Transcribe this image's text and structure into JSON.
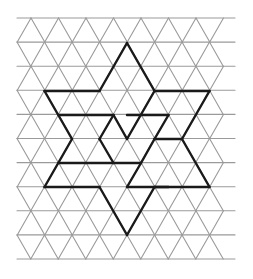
{
  "diagram": {
    "type": "triangular-grid-star",
    "colors": {
      "background": "#ffffff",
      "grid": "#9a9a9a",
      "figure": "#1a1a1a"
    },
    "grid": {
      "rows": 10,
      "row_spacing": 24.1,
      "col_spacing": 27.5,
      "top": 18,
      "left_even_row": 31,
      "left_odd_row": 17,
      "left_edge": 17,
      "right_edge": 235
    },
    "star_segments": [
      [
        [
          44.5,
          91
        ],
        [
          99.5,
          91
        ]
      ],
      [
        [
          99.5,
          91
        ],
        [
          127,
          43
        ]
      ],
      [
        [
          127,
          43
        ],
        [
          154.5,
          91
        ]
      ],
      [
        [
          154.5,
          91
        ],
        [
          209.5,
          91
        ]
      ],
      [
        [
          209.5,
          91
        ],
        [
          182,
          139
        ]
      ],
      [
        [
          182,
          139
        ],
        [
          209.5,
          187
        ]
      ],
      [
        [
          209.5,
          187
        ],
        [
          154.5,
          187
        ]
      ],
      [
        [
          154.5,
          187
        ],
        [
          127,
          235
        ]
      ],
      [
        [
          127,
          235
        ],
        [
          99.5,
          187
        ]
      ],
      [
        [
          99.5,
          187
        ],
        [
          44.5,
          187
        ]
      ],
      [
        [
          44.5,
          187
        ],
        [
          72,
          139
        ]
      ],
      [
        [
          72,
          139
        ],
        [
          44.5,
          91
        ]
      ],
      [
        [
          58.5,
          115
        ],
        [
          113.5,
          115
        ]
      ],
      [
        [
          113.5,
          115
        ],
        [
          99.5,
          139
        ]
      ],
      [
        [
          99.5,
          139
        ],
        [
          113.5,
          163
        ]
      ],
      [
        [
          113.5,
          115
        ],
        [
          127,
          139
        ]
      ],
      [
        [
          154.5,
          91
        ],
        [
          127,
          139
        ]
      ],
      [
        [
          127,
          115
        ],
        [
          168.5,
          115
        ]
      ],
      [
        [
          168.5,
          115
        ],
        [
          154.5,
          139
        ]
      ],
      [
        [
          154.5,
          139
        ],
        [
          182,
          139
        ]
      ],
      [
        [
          58.5,
          163
        ],
        [
          141,
          163
        ]
      ],
      [
        [
          141,
          163
        ],
        [
          154.5,
          139
        ]
      ],
      [
        [
          141,
          163
        ],
        [
          127,
          187
        ]
      ],
      [
        [
          127,
          187
        ],
        [
          168.5,
          187
        ]
      ]
    ]
  }
}
